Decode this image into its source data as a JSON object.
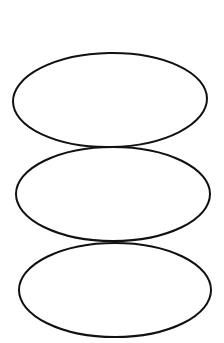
{
  "diagram": {
    "type": "stacked-ellipses",
    "background": "#ffffff",
    "stroke": "#111111",
    "stroke_width": 2,
    "shapes": [
      {
        "name": "top-ellipse",
        "cx": 110,
        "cy": 100,
        "rx": 97,
        "ry": 47,
        "rotate": -1
      },
      {
        "name": "middle-ellipse",
        "cx": 113,
        "cy": 194,
        "rx": 97,
        "ry": 47,
        "rotate": 0
      },
      {
        "name": "bottom-ellipse",
        "cx": 115,
        "cy": 290,
        "rx": 96,
        "ry": 47,
        "rotate": 0
      }
    ]
  }
}
